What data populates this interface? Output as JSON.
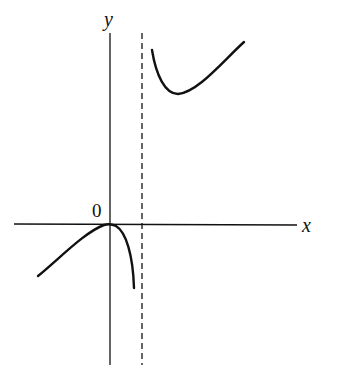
{
  "diagram": {
    "type": "function-graph-sketch",
    "axes": {
      "x_label": "x",
      "y_label": "y",
      "origin_label": "0"
    },
    "asymptote": {
      "kind": "vertical",
      "style": "dashed",
      "position": "x = a (a > 0)"
    },
    "branches": [
      {
        "name": "left-branch",
        "description": "rises from lower-left to a maximum touching the origin, then falls to -infinity approaching the asymptote"
      },
      {
        "name": "right-branch",
        "description": "descends from +infinity near the asymptote to a local minimum, then rises to the upper right"
      }
    ],
    "colors": {
      "ink": "#111111",
      "background": "#ffffff"
    }
  }
}
